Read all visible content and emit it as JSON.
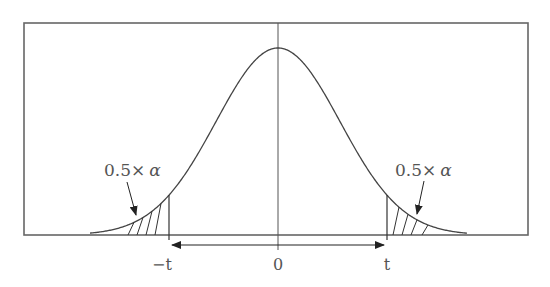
{
  "diagram": {
    "title": "",
    "type": "two-tailed t-distribution critical region",
    "colors": {
      "frame": "#666666",
      "curve": "#444444",
      "text": "#555555",
      "background": "#ffffff"
    },
    "frame": {
      "x": 24,
      "y": 23,
      "width": 504,
      "height": 212
    },
    "axis": {
      "baseline_y": 235,
      "ticks": [
        {
          "id": "neg-t",
          "x": 169,
          "label": "−t"
        },
        {
          "id": "zero",
          "x": 278,
          "label": "0"
        },
        {
          "id": "pos-t",
          "x": 387,
          "label": "t"
        }
      ]
    },
    "curve": {
      "peak_x": 278,
      "peak_y": 48,
      "left_end_x": 90,
      "right_end_x": 467
    },
    "annotations": {
      "left_tail": {
        "prefix": "0.5×",
        "symbol": "α"
      },
      "right_tail": {
        "prefix": "0.5×",
        "symbol": "α"
      }
    },
    "double_arrow": {
      "from_x": 169,
      "to_x": 387,
      "y": 245
    }
  }
}
